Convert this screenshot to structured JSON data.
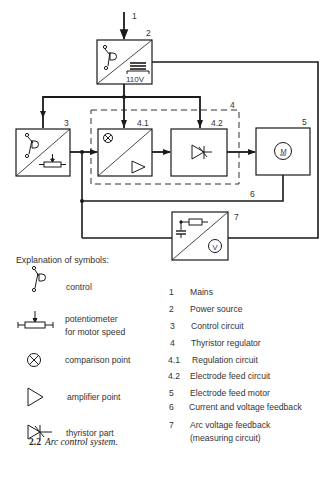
{
  "diagram": {
    "labels": {
      "mains_input": "1",
      "power_source": "2",
      "control_circuit": "3",
      "thyristor_regulator": "4",
      "regulation_circuit": "4.1",
      "electrode_feed_circuit": "4.2",
      "electrode_feed_motor": "5",
      "feedback_line": "6",
      "arc_voltage_feedback": "7"
    },
    "power_voltage": "110V",
    "motor_symbol": "M",
    "voltmeter_symbol": "V"
  },
  "symbols": {
    "heading": "Explanation of symbols:",
    "items": [
      {
        "icon": "control-switch-icon",
        "label": "control"
      },
      {
        "icon": "potentiometer-icon",
        "label_line1": "potentiometer",
        "label_line2": "for motor speed"
      },
      {
        "icon": "comparison-point-icon",
        "label": "comparison point"
      },
      {
        "icon": "amplifier-icon",
        "label": "amplifier point"
      },
      {
        "icon": "thyristor-icon",
        "label": "thyristor part"
      }
    ]
  },
  "legend": [
    {
      "num": "1",
      "text": "Mains"
    },
    {
      "num": "2",
      "text": "Power source"
    },
    {
      "num": "3",
      "text": "Control circuit"
    },
    {
      "num": "4",
      "text": "Thyristor regulator"
    },
    {
      "num": "4.1",
      "text": "Regulation circuit"
    },
    {
      "num": "4.2",
      "text": "Electrode feed circuit"
    },
    {
      "num": "5",
      "text": "Electrode feed motor"
    },
    {
      "num": "6",
      "text": "Current and voltage feedback"
    },
    {
      "num": "7",
      "text": "Arc voltage feedback",
      "text2": "(measuring circuit)"
    }
  ],
  "caption": {
    "number": "2.2",
    "title": "Arc control system."
  }
}
